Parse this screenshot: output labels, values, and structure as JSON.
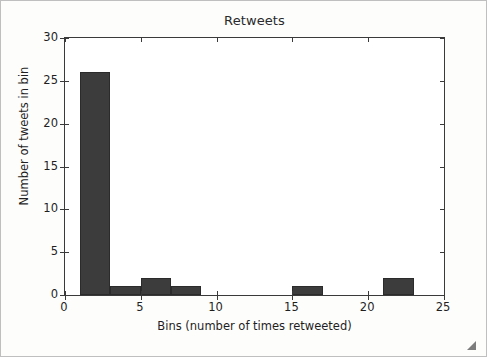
{
  "chart_data": {
    "type": "bar",
    "title": "Retweets",
    "xlabel": "Bins (number of times retweeted)",
    "ylabel": "Number of tweets in bin",
    "xlim": [
      0,
      25
    ],
    "ylim": [
      0,
      30
    ],
    "grid": false,
    "legend": null,
    "bin_width": 2,
    "bar_color": "#3c3c3c",
    "bar_edge_color": "#2b2b2b",
    "x_ticks": [
      0,
      5,
      10,
      15,
      20,
      25
    ],
    "y_ticks": [
      0,
      5,
      10,
      15,
      20,
      25,
      30
    ],
    "x_tick_labels": [
      "0",
      "5",
      "10",
      "15",
      "20",
      "25"
    ],
    "y_tick_labels": [
      "0",
      "5",
      "10",
      "15",
      "20",
      "25",
      "30"
    ],
    "bins": [
      {
        "start": 1,
        "end": 3,
        "value": 26
      },
      {
        "start": 3,
        "end": 5,
        "value": 1
      },
      {
        "start": 5,
        "end": 7,
        "value": 2
      },
      {
        "start": 7,
        "end": 9,
        "value": 1
      },
      {
        "start": 15,
        "end": 17,
        "value": 1
      },
      {
        "start": 21,
        "end": 23,
        "value": 2
      }
    ],
    "categories": [
      "1-3",
      "3-5",
      "5-7",
      "7-9",
      "15-17",
      "21-23"
    ],
    "values": [
      26,
      1,
      2,
      1,
      1,
      2
    ]
  },
  "figure": {
    "background": "#fdfdfc",
    "border_color": "#bfbfbf",
    "axes_color": "#3a3a3a"
  },
  "resize_handle": {
    "name": "resize-handle"
  }
}
